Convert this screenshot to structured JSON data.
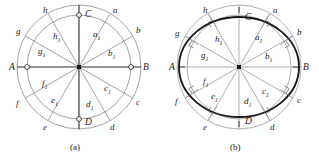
{
  "figure": {
    "panels": [
      {
        "id": "a",
        "caption": "(a)",
        "caption_letter": "a",
        "description": "Two concentric circles with twelve radial half-lines; outer intersection points a-h, inner intersection points a1-h1, axis endpoints A, B, C, D.",
        "has_ellipse": false,
        "axis_points": [
          {
            "name": "A",
            "label": "A",
            "angle_deg": 180,
            "marker": "open-circle"
          },
          {
            "name": "B",
            "label": "B",
            "angle_deg": 0,
            "marker": "open-circle"
          },
          {
            "name": "C",
            "label": "C",
            "angle_deg": 90,
            "marker": "open-circle"
          },
          {
            "name": "D",
            "label": "D",
            "angle_deg": 270,
            "marker": "open-circle"
          }
        ],
        "outer_points": [
          {
            "name": "a",
            "label": "a",
            "angle_deg": 60
          },
          {
            "name": "b",
            "label": "b",
            "angle_deg": 30
          },
          {
            "name": "c",
            "label": "c",
            "angle_deg": -30
          },
          {
            "name": "d",
            "label": "d",
            "angle_deg": -60
          },
          {
            "name": "e",
            "label": "e",
            "angle_deg": -120
          },
          {
            "name": "f",
            "label": "f",
            "angle_deg": -150
          },
          {
            "name": "g",
            "label": "g",
            "angle_deg": 150
          },
          {
            "name": "h",
            "label": "h",
            "angle_deg": 120
          }
        ],
        "inner_points": [
          {
            "name": "a1",
            "label": "a",
            "sub": "1",
            "angle_deg": 60
          },
          {
            "name": "b1",
            "label": "b",
            "sub": "1",
            "angle_deg": 30
          },
          {
            "name": "c1",
            "label": "c",
            "sub": "1",
            "angle_deg": -30
          },
          {
            "name": "d1",
            "label": "d",
            "sub": "1",
            "angle_deg": -60
          },
          {
            "name": "e1",
            "label": "e",
            "sub": "1",
            "angle_deg": -120
          },
          {
            "name": "f1",
            "label": "f",
            "sub": "1",
            "angle_deg": -150
          },
          {
            "name": "g1",
            "label": "g",
            "sub": "1",
            "angle_deg": 150
          },
          {
            "name": "h1",
            "label": "h",
            "sub": "1",
            "angle_deg": 120
          }
        ]
      },
      {
        "id": "b",
        "caption": "(b)",
        "caption_letter": "b",
        "description": "Same construction as (a) with a heavy inscribed ellipse and right-angle tick marks at the ellipse intersections.",
        "has_ellipse": true,
        "axis_points": [
          {
            "name": "A",
            "label": "A",
            "angle_deg": 180,
            "marker": "tick"
          },
          {
            "name": "B",
            "label": "B",
            "angle_deg": 0,
            "marker": "tick"
          },
          {
            "name": "C",
            "label": "C",
            "angle_deg": 90,
            "marker": "tick"
          },
          {
            "name": "D",
            "label": "D",
            "angle_deg": 270,
            "marker": "tick"
          }
        ],
        "outer_points": [
          {
            "name": "a",
            "label": "a",
            "angle_deg": 60
          },
          {
            "name": "b",
            "label": "b",
            "angle_deg": 30
          },
          {
            "name": "c",
            "label": "c",
            "angle_deg": -30
          },
          {
            "name": "d",
            "label": "d",
            "angle_deg": -60
          },
          {
            "name": "e",
            "label": "e",
            "angle_deg": -120
          },
          {
            "name": "f",
            "label": "f",
            "angle_deg": -150
          },
          {
            "name": "g",
            "label": "g",
            "angle_deg": 150
          },
          {
            "name": "h",
            "label": "h",
            "angle_deg": 120
          }
        ],
        "inner_points": [
          {
            "name": "a1",
            "label": "a",
            "sub": "1",
            "angle_deg": 60
          },
          {
            "name": "b1",
            "label": "b",
            "sub": "1",
            "angle_deg": 30
          },
          {
            "name": "c1",
            "label": "c",
            "sub": "1",
            "angle_deg": -30
          },
          {
            "name": "d1",
            "label": "d",
            "sub": "1",
            "angle_deg": -60
          },
          {
            "name": "e1",
            "label": "e",
            "sub": "1",
            "angle_deg": -120
          },
          {
            "name": "f1",
            "label": "f",
            "sub": "1",
            "angle_deg": -150
          },
          {
            "name": "g1",
            "label": "g",
            "sub": "1",
            "angle_deg": 150
          },
          {
            "name": "h1",
            "label": "h",
            "sub": "1",
            "angle_deg": 120
          }
        ]
      }
    ]
  },
  "geometry": {
    "center_x": 79,
    "center_y": 67,
    "outer_radius": 62,
    "inner_radius": 52,
    "ellipse_rx": 60,
    "ellipse_ry": 50,
    "radial_line_count": 12,
    "radial_angle_step_deg": 30
  },
  "colors": {
    "line_light": "#8c8c8c",
    "line_dark": "#2b2b2b",
    "ellipse": "#1a1a1a",
    "text": "#1a1a1a",
    "background": "#ffffff"
  },
  "captions": {
    "panel_a": "(a)",
    "panel_b": "(b)"
  }
}
